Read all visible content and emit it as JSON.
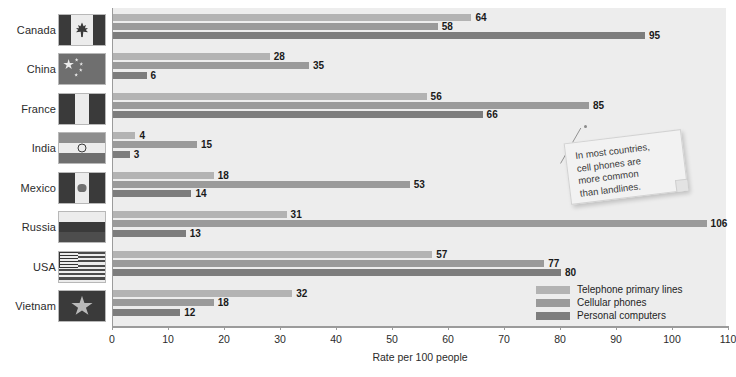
{
  "chart_data": {
    "type": "bar",
    "orientation": "horizontal",
    "title": "",
    "xlabel": "Rate per 100 people",
    "ylabel": "",
    "xlim": [
      0,
      110
    ],
    "xticks": [
      0,
      10,
      20,
      30,
      40,
      50,
      60,
      70,
      80,
      90,
      100,
      110
    ],
    "grid": false,
    "legend_position": "bottom-right",
    "categories": [
      "Canada",
      "China",
      "France",
      "India",
      "Mexico",
      "Russia",
      "USA",
      "Vietnam"
    ],
    "series": [
      {
        "name": "Telephone primary lines",
        "color": "#b3b3b3",
        "values": [
          64,
          28,
          56,
          4,
          18,
          31,
          57,
          32
        ]
      },
      {
        "name": "Cellular phones",
        "color": "#9a9a9a",
        "values": [
          58,
          35,
          85,
          15,
          53,
          106,
          77,
          18
        ]
      },
      {
        "name": "Personal computers",
        "color": "#7d7d7d",
        "values": [
          95,
          6,
          66,
          3,
          14,
          13,
          80,
          12
        ]
      }
    ],
    "annotations": [
      {
        "text": "In most countries, cell phones are more common than landlines.",
        "points_to": "France cellular phones bar (85)"
      }
    ]
  },
  "axis": {
    "title": "Rate per 100 people",
    "tick_labels": [
      "0",
      "10",
      "20",
      "30",
      "40",
      "50",
      "60",
      "70",
      "80",
      "90",
      "100",
      "110"
    ]
  },
  "legend": {
    "items": [
      {
        "label": "Telephone primary lines",
        "color": "#b3b3b3"
      },
      {
        "label": "Cellular phones",
        "color": "#9a9a9a"
      },
      {
        "label": "Personal computers",
        "color": "#7d7d7d"
      }
    ]
  },
  "callout": {
    "line1": "In most countries,",
    "line2": "cell phones are",
    "line3": "more common",
    "line4": "than landlines."
  },
  "rows": [
    {
      "country": "Canada",
      "flag": "flag-canada",
      "values": [
        64,
        58,
        95
      ]
    },
    {
      "country": "China",
      "flag": "flag-china",
      "values": [
        28,
        35,
        6
      ]
    },
    {
      "country": "France",
      "flag": "flag-france",
      "values": [
        56,
        85,
        66
      ]
    },
    {
      "country": "India",
      "flag": "flag-india",
      "values": [
        4,
        15,
        3
      ]
    },
    {
      "country": "Mexico",
      "flag": "flag-mexico",
      "values": [
        18,
        53,
        14
      ]
    },
    {
      "country": "Russia",
      "flag": "flag-russia",
      "values": [
        31,
        106,
        13
      ]
    },
    {
      "country": "USA",
      "flag": "flag-usa",
      "values": [
        57,
        77,
        80
      ]
    },
    {
      "country": "Vietnam",
      "flag": "flag-vietnam",
      "values": [
        32,
        18,
        12
      ]
    }
  ]
}
